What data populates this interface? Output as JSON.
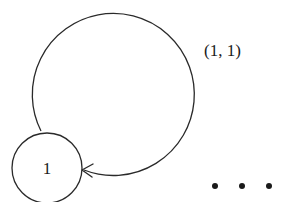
{
  "diagram": {
    "type": "state-transition-graph",
    "nodes": [
      {
        "id": "node-1",
        "label": "1"
      }
    ],
    "edges": [
      {
        "from": "node-1",
        "to": "node-1",
        "label": "(1, 1)",
        "kind": "self-loop"
      }
    ],
    "continuation": "• • •",
    "colors": {
      "stroke": "#2a2a2a",
      "text": "#1a1a1a",
      "background": "#ffffff"
    }
  }
}
